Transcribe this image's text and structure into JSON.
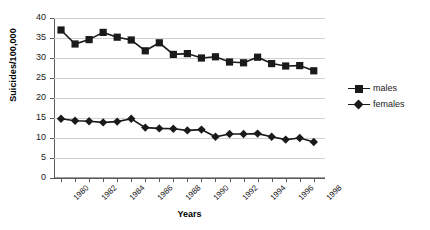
{
  "chart_data": {
    "type": "line",
    "title": "",
    "xlabel": "Years",
    "ylabel": "Suicides/100,000",
    "x": [
      1980,
      1981,
      1982,
      1983,
      1984,
      1985,
      1986,
      1987,
      1988,
      1989,
      1990,
      1991,
      1992,
      1993,
      1994,
      1995,
      1996,
      1997,
      1998
    ],
    "xlim": [
      1979.5,
      1998.8
    ],
    "ylim": [
      0,
      40
    ],
    "yticks": [
      0,
      5,
      10,
      15,
      20,
      25,
      30,
      35,
      40
    ],
    "xtick_labels": [
      "1980",
      "1982",
      "1984",
      "1986",
      "1988",
      "1990",
      "1992",
      "1994",
      "1996",
      "1998"
    ],
    "xtick_values": [
      1980,
      1982,
      1984,
      1986,
      1988,
      1990,
      1992,
      1994,
      1996,
      1998
    ],
    "grid": true,
    "grid_axis": "y",
    "legend_position": "right",
    "series": [
      {
        "name": "males",
        "marker": "square",
        "color": "#1a1a1a",
        "values": [
          37.0,
          33.5,
          34.6,
          36.4,
          35.2,
          34.5,
          31.8,
          33.8,
          30.9,
          31.1,
          30.0,
          30.3,
          29.0,
          28.8,
          30.2,
          28.6,
          28.0,
          28.1,
          26.8
        ]
      },
      {
        "name": "females",
        "marker": "diamond",
        "color": "#1a1a1a",
        "values": [
          14.8,
          14.3,
          14.2,
          13.9,
          14.1,
          14.8,
          12.6,
          12.4,
          12.3,
          11.9,
          12.1,
          10.3,
          11.0,
          11.0,
          11.1,
          10.3,
          9.6,
          10.0,
          9.0
        ]
      }
    ]
  },
  "legend": {
    "items": [
      {
        "label": "males"
      },
      {
        "label": "females"
      }
    ]
  }
}
